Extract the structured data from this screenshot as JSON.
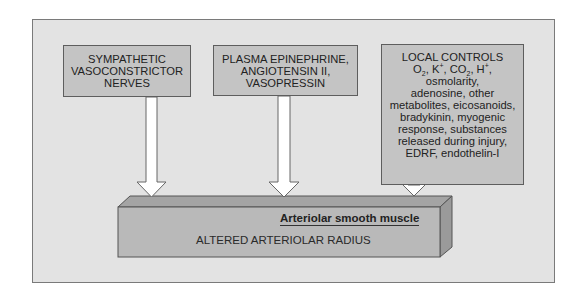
{
  "diagram": {
    "colors": {
      "background": "#ffffff",
      "panel": "#e3e3e3",
      "box_fill": "#c4c4c4",
      "box_border": "#5e5e5e",
      "arrow_fill": "#ffffff",
      "block_front": "#b9b9b9",
      "block_top": "#a4a4a4",
      "block_side": "#9a9a9a"
    },
    "inputs": [
      {
        "id": "box1",
        "lines": [
          "SYMPATHETIC",
          "VASOCONSTRICTOR",
          "NERVES"
        ]
      },
      {
        "id": "box2",
        "lines": [
          "PLASMA EPINEPHRINE,",
          "ANGIOTENSIN II,",
          "VASOPRESSIN"
        ]
      },
      {
        "id": "box3",
        "heading": "LOCAL CONTROLS",
        "ions_line": {
          "o": "O",
          "o_sub": "2",
          "k": "K",
          "k_sup": "+",
          "co": "CO",
          "co_sub": "2",
          "h": "H",
          "h_sup": "+"
        },
        "lines": [
          "osmolarity,",
          "adenosine, other",
          "metabolites, eicosanoids,",
          "bradykinin, myogenic",
          "response, substances",
          "released during injury,",
          "EDRF, endothelin-I"
        ]
      }
    ],
    "target": {
      "label": "Arteriolar smooth muscle",
      "text": "ALTERED ARTERIOLAR RADIUS"
    },
    "arrows": [
      {
        "from": "box1",
        "to": "target"
      },
      {
        "from": "box2",
        "to": "target"
      },
      {
        "from": "box3",
        "to": "target"
      }
    ]
  }
}
